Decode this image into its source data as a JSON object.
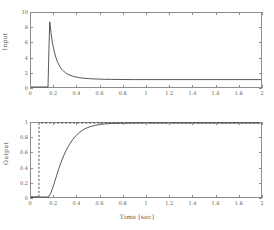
{
  "chart_data": [
    {
      "id": "input",
      "type": "line",
      "title": "",
      "xlabel": "",
      "ylabel": "Input",
      "xlim": [
        0,
        2
      ],
      "ylim": [
        0,
        10
      ],
      "grid": false,
      "legend": "none",
      "xticks": [
        0,
        0.2,
        0.4,
        0.6,
        0.8,
        1,
        1.2,
        1.4,
        1.6,
        1.8,
        2
      ],
      "xticklabels": [
        "0",
        "0.2",
        "0.4",
        "0.6",
        "0.8",
        "1",
        "1.2",
        "1.4",
        "1.6",
        "1.8",
        "2"
      ],
      "yticks": [
        0,
        2,
        4,
        6,
        8,
        10
      ],
      "yticklabels": [
        "0",
        "2",
        "4",
        "6",
        "8",
        "10"
      ],
      "series": [
        {
          "name": "input signal",
          "style": "solid",
          "color": "#3a3a3a",
          "description": "Zero until t=0.15 s, sharp rise to a peak of 8.8 at t=0.165 s, exponential decay to a steady value of 1.0 by t=0.7 s, flat thereafter to t=2 s.",
          "x": [
            0,
            0.02,
            0.04,
            0.06,
            0.08,
            0.1,
            0.12,
            0.14,
            0.148,
            0.152,
            0.158,
            0.163,
            0.168,
            0.175,
            0.185,
            0.2,
            0.215,
            0.23,
            0.25,
            0.27,
            0.29,
            0.31,
            0.33,
            0.36,
            0.39,
            0.42,
            0.45,
            0.5,
            0.55,
            0.6,
            0.65,
            0.7,
            0.8,
            0.9,
            1.0,
            1.2,
            1.4,
            1.6,
            1.8,
            2.0
          ],
          "y": [
            0,
            0,
            0,
            0,
            0,
            0,
            0,
            0,
            0,
            2.6,
            6.3,
            8.8,
            8.2,
            7.2,
            6.1,
            4.9,
            4.05,
            3.4,
            2.78,
            2.35,
            2.04,
            1.82,
            1.65,
            1.47,
            1.35,
            1.26,
            1.2,
            1.13,
            1.09,
            1.06,
            1.04,
            1.03,
            1.01,
            1.0,
            1.0,
            1.0,
            1.0,
            1.0,
            1.0,
            1.0
          ]
        }
      ]
    },
    {
      "id": "output",
      "type": "line",
      "title": "",
      "xlabel": "Time [sec]",
      "ylabel": "Output",
      "xlim": [
        0,
        2
      ],
      "ylim": [
        0,
        1
      ],
      "grid": false,
      "legend": "none",
      "xticks": [
        0,
        0.2,
        0.4,
        0.6,
        0.8,
        1,
        1.2,
        1.4,
        1.6,
        1.8,
        2
      ],
      "xticklabels": [
        "0",
        "0.2",
        "0.4",
        "0.6",
        "0.8",
        "1",
        "1.2",
        "1.4",
        "1.6",
        "1.8",
        "2"
      ],
      "yticks": [
        0,
        0.2,
        0.4,
        0.6,
        0.8,
        1
      ],
      "yticklabels": [
        "0",
        "0.2",
        "0.4",
        "0.6",
        "0.8",
        "1"
      ],
      "series": [
        {
          "name": "reference step",
          "style": "dashed",
          "color": "#3a3a3a",
          "description": "Ideal step reference: 0 until t=0.07 s then instantaneously 1.0 and flat to t=2 s.",
          "x": [
            0,
            0.069,
            0.07,
            0.2,
            0.5,
            1.0,
            1.5,
            2.0
          ],
          "y": [
            0,
            0,
            1,
            1,
            1,
            1,
            1,
            1
          ]
        },
        {
          "name": "system output",
          "style": "solid",
          "color": "#3a3a3a",
          "description": "Zero until t=0.15 s, then smooth first-order-like rise reaching 0.9 near t=0.45 s and settling at 1.0 by t=0.7 s, flat to t=2 s.",
          "x": [
            0,
            0.05,
            0.1,
            0.14,
            0.15,
            0.17,
            0.19,
            0.21,
            0.24,
            0.27,
            0.3,
            0.33,
            0.36,
            0.39,
            0.42,
            0.45,
            0.48,
            0.52,
            0.56,
            0.6,
            0.65,
            0.7,
            0.8,
            0.9,
            1.0,
            1.2,
            1.4,
            1.6,
            1.8,
            2.0
          ],
          "y": [
            0,
            0,
            0,
            0,
            0,
            0.045,
            0.13,
            0.225,
            0.375,
            0.505,
            0.615,
            0.7,
            0.772,
            0.828,
            0.872,
            0.905,
            0.93,
            0.953,
            0.969,
            0.98,
            0.989,
            0.994,
            0.998,
            1.0,
            1.0,
            1.0,
            1.0,
            1.0,
            1.0,
            1.0
          ]
        }
      ]
    }
  ],
  "labels": {
    "xlabel_time": "Time [sec]",
    "ylabel_input": "Input",
    "ylabel_output": "Output"
  }
}
